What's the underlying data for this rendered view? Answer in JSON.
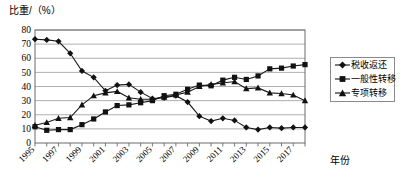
{
  "chart_data": {
    "type": "line",
    "title": "",
    "ylabel": "比重/（%）",
    "xlabel": "年份",
    "ylim": [
      0,
      80
    ],
    "ytick_step": 10,
    "yticks": [
      "0",
      "10",
      "20",
      "30",
      "40",
      "50",
      "60",
      "70",
      "80"
    ],
    "grid": true,
    "legend_position": "right",
    "x": [
      1995,
      1996,
      1997,
      1998,
      1999,
      2000,
      2001,
      2002,
      2003,
      2004,
      2005,
      2006,
      2007,
      2008,
      2009,
      2010,
      2011,
      2012,
      2013,
      2014,
      2015,
      2016,
      2017,
      2018
    ],
    "xtick_labels": [
      "1995",
      "1997",
      "1999",
      "2001",
      "2003",
      "2005",
      "2007",
      "2009",
      "2011",
      "2013",
      "2015",
      "2017"
    ],
    "series": [
      {
        "name": "税收返还",
        "marker": "diamond",
        "values": [
          73.5,
          73.0,
          72.0,
          63.5,
          51.0,
          46.5,
          37.0,
          41.0,
          41.5,
          36.0,
          31.5,
          32.0,
          33.5,
          29.0,
          19.0,
          15.5,
          17.5,
          16.0,
          11.0,
          9.5,
          11.0,
          10.5,
          11.0,
          11.0
        ]
      },
      {
        "name": "一般性转移",
        "marker": "square",
        "values": [
          11.5,
          9.0,
          9.5,
          9.5,
          13.0,
          17.0,
          22.0,
          26.5,
          27.0,
          28.5,
          30.0,
          33.5,
          34.5,
          38.0,
          41.0,
          40.5,
          44.5,
          46.5,
          45.0,
          47.5,
          52.5,
          53.0,
          54.5,
          55.5
        ]
      },
      {
        "name": "专项转移",
        "marker": "triangle",
        "values": [
          12.5,
          14.5,
          17.5,
          18.0,
          27.0,
          33.5,
          35.5,
          36.5,
          32.0,
          31.0,
          31.0,
          32.5,
          34.0,
          36.0,
          40.0,
          41.5,
          42.5,
          43.5,
          38.5,
          39.0,
          35.5,
          35.0,
          34.0,
          30.0
        ]
      }
    ],
    "colors": {
      "line": "#1a1a1a",
      "marker": "#111111",
      "grid": "#9a9a9a",
      "frame": "#6b6b6b",
      "background": "#ffffff"
    }
  },
  "legend": {
    "items": [
      {
        "label": "税收返还",
        "marker": "diamond"
      },
      {
        "label": "一般性转移",
        "marker": "square"
      },
      {
        "label": "专项转移",
        "marker": "triangle"
      }
    ]
  }
}
